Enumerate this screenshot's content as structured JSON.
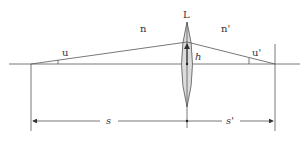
{
  "diagram": {
    "type": "thin-lens-ray-diagram",
    "labels": {
      "lens": "L",
      "object_index": "n",
      "image_index": "n'",
      "object_angle": "u",
      "image_angle": "u'",
      "height": "h",
      "object_distance": "s",
      "image_distance": "s'"
    },
    "colors": {
      "line": "#555555",
      "lens_fill": "#dcdcdc",
      "text": "#333333"
    }
  }
}
